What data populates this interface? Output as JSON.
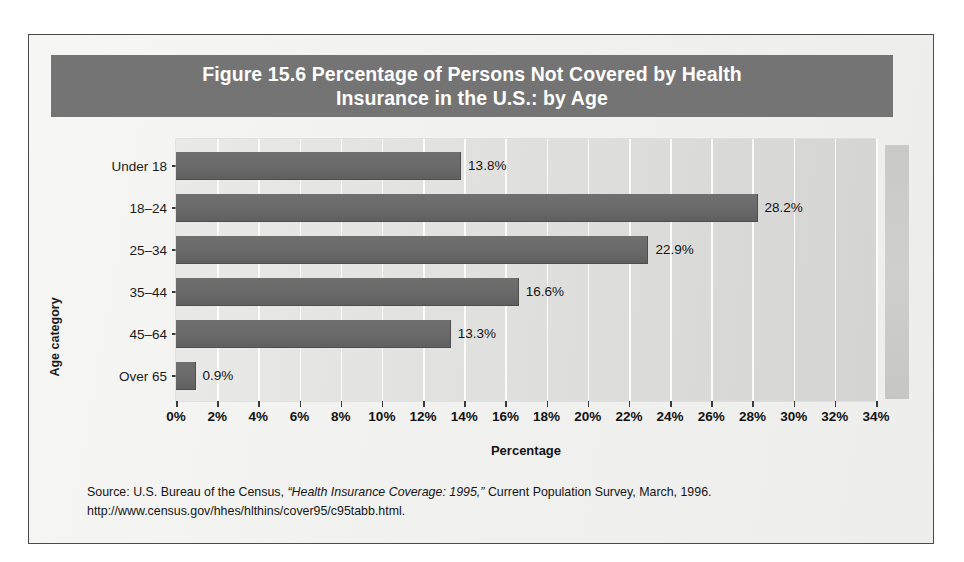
{
  "figure": {
    "title": "Figure 15.6  Percentage of Persons Not Covered by Health Insurance in the U.S.: by Age",
    "title_line_1": "Figure 15.6  Percentage of Persons Not Covered by Health",
    "title_line_2": "Insurance in the U.S.: by Age",
    "banner_color": "#747474",
    "bar_color": "#696969",
    "panel_color": "#dededd",
    "gridline_color": "#fbfbfb",
    "frame_border_color": "#4a4a4a"
  },
  "source": {
    "line_1_prefix": "Source: U.S. Bureau of the Census, ",
    "line_1_italic": "“Health Insurance Coverage: 1995,”",
    "line_1_suffix": " Current Population Survey, March, 1996.",
    "line_2": "http://www.census.gov/hhes/hlthins/cover95/c95tabb.html."
  },
  "chart_data": {
    "type": "bar",
    "orientation": "horizontal",
    "title": "Figure 15.6  Percentage of Persons Not Covered by Health Insurance in the U.S.: by Age",
    "xlabel": "Percentage",
    "ylabel": "Age category",
    "categories": [
      "Under 18",
      "18–24",
      "25–34",
      "35–44",
      "45–64",
      "Over 65"
    ],
    "values": [
      13.8,
      28.2,
      22.9,
      16.6,
      13.3,
      0.9
    ],
    "value_labels": [
      "13.8%",
      "28.2%",
      "22.9%",
      "16.6%",
      "13.3%",
      "0.9%"
    ],
    "xlim": [
      0,
      34
    ],
    "xtick_values": [
      0,
      2,
      4,
      6,
      8,
      10,
      12,
      14,
      16,
      18,
      20,
      22,
      24,
      26,
      28,
      30,
      32,
      34
    ],
    "xtick_labels": [
      "0%",
      "2%",
      "4%",
      "6%",
      "8%",
      "10%",
      "12%",
      "14%",
      "16%",
      "18%",
      "20%",
      "22%",
      "24%",
      "26%",
      "28%",
      "30%",
      "32%",
      "34%"
    ],
    "grid": "vertical",
    "legend": "none",
    "series": [
      {
        "name": "Percent not covered",
        "values": [
          13.8,
          28.2,
          22.9,
          16.6,
          13.3,
          0.9
        ]
      }
    ]
  }
}
